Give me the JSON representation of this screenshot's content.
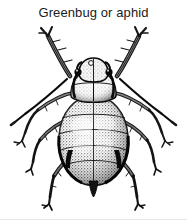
{
  "figure": {
    "caption": "Greenbug or aphid",
    "background_color": "#ffffff",
    "ink_color": "#1a1a1a",
    "width_px": 187,
    "height_px": 220
  },
  "illustration": {
    "subject": "aphid",
    "view": "dorsal",
    "style": "black-and-white stippled engraving",
    "parts": {
      "head": "head",
      "eye_left": "compound-eye-left",
      "eye_right": "compound-eye-right",
      "antenna_left": "antenna-left",
      "antenna_right": "antenna-right",
      "thorax": "thorax",
      "abdomen": "abdomen",
      "cauda": "cauda",
      "cornicle_left": "cornicle-left",
      "cornicle_right": "cornicle-right",
      "leg_front_left": "foreleg-left",
      "leg_front_right": "foreleg-right",
      "leg_mid_left": "midleg-left",
      "leg_mid_right": "midleg-right",
      "leg_hind_left": "hindleg-left",
      "leg_hind_right": "hindleg-right"
    }
  }
}
